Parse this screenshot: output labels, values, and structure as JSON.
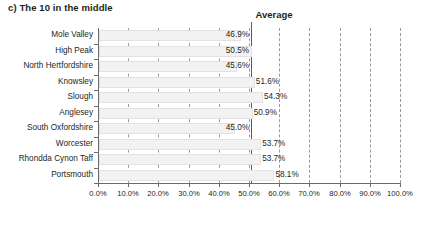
{
  "title": "c) The 10 in the middle",
  "average_label": "Average",
  "colors": {
    "bar_fill": "#f2f2f2",
    "bar_border": "#e2e2e2",
    "axis": "#6b6b6b",
    "gridline": "#9a9a9a",
    "average_line": "#5a5a5a",
    "text": "#231f20"
  },
  "chart_data": {
    "type": "bar",
    "orientation": "horizontal",
    "title": "c) The 10 in the middle",
    "xlabel": "",
    "ylabel": "",
    "xlim": [
      0,
      100
    ],
    "grid": true,
    "legend": null,
    "categories": [
      "Mole Valley",
      "High Peak",
      "North Hertfordshire",
      "Knowsley",
      "Slough",
      "Anglesey",
      "South Oxfordshire",
      "Worcester",
      "Rhondda Cynon Taff",
      "Portsmouth"
    ],
    "values": [
      46.9,
      50.5,
      45.6,
      51.6,
      54.3,
      50.9,
      45.0,
      53.7,
      53.7,
      58.1
    ],
    "value_labels": [
      "46.9%",
      "50.5%",
      "45.6%",
      "51.6%",
      "54.3%",
      "50.9%",
      "45.0%",
      "53.7%",
      "53.7%",
      "58.1%"
    ],
    "xticks": [
      0,
      10,
      20,
      30,
      40,
      50,
      60,
      70,
      80,
      90,
      100
    ],
    "xtick_labels": [
      "0.0%",
      "10.0%",
      "20.0%",
      "30.0%",
      "40.0%",
      "50.0%",
      "60.0%",
      "70.0%",
      "80.0%",
      "90.0%",
      "100.0%"
    ],
    "annotations": [
      {
        "name": "average",
        "label": "Average",
        "value": 50.8,
        "style": "solid-vertical-line"
      }
    ]
  }
}
